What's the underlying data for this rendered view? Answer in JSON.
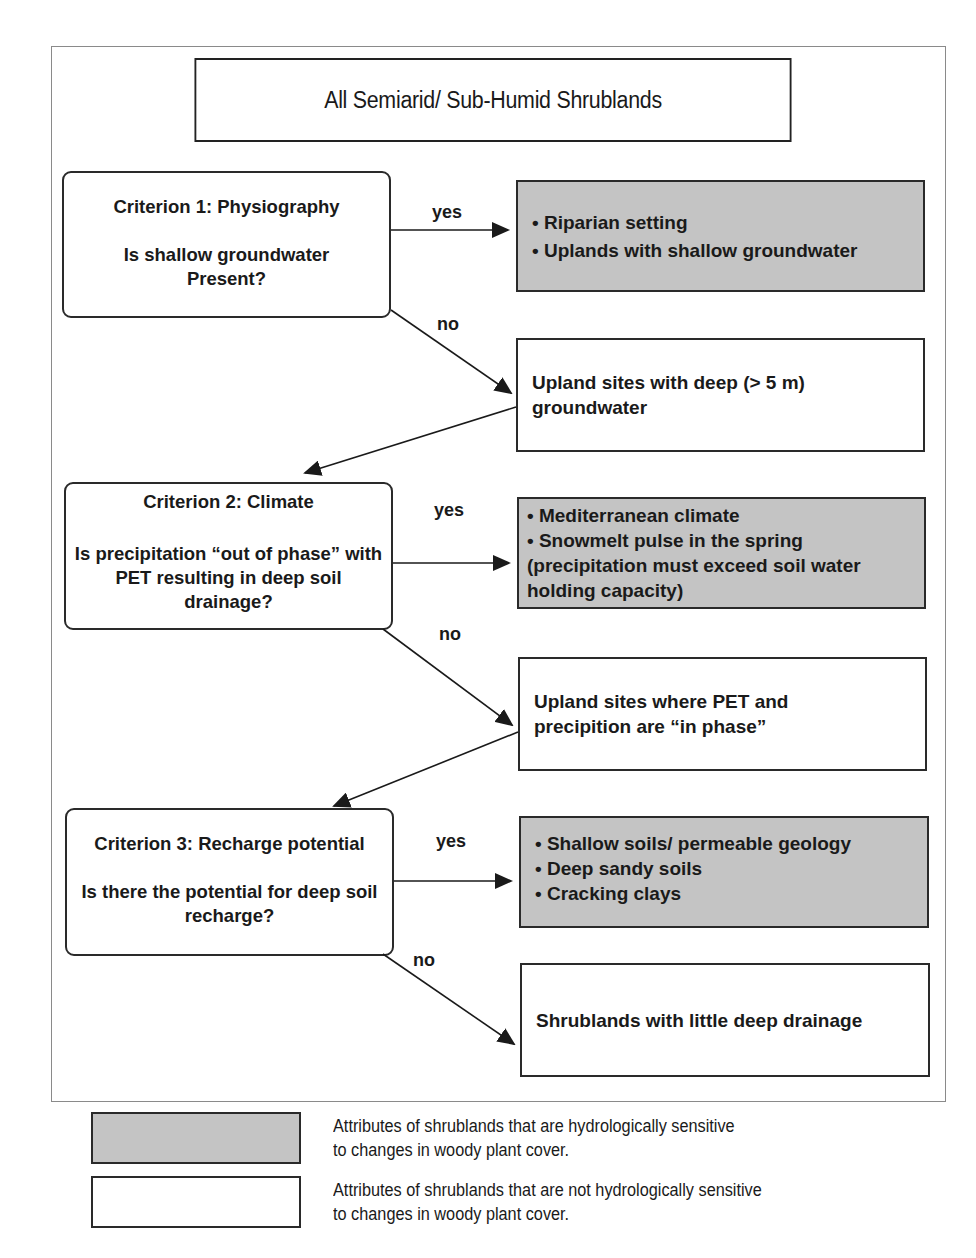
{
  "title": "All Semiarid/ Sub-Humid Shrublands",
  "colors": {
    "sensitive_fill": "#c4c4c4",
    "not_sensitive_fill": "#ffffff",
    "line": "#1a1a1a"
  },
  "criteria": [
    {
      "heading": "Criterion 1: Physiography",
      "question": "Is shallow groundwater Present?",
      "yes_label": "yes",
      "no_label": "no",
      "yes_outcome": {
        "sensitive": true,
        "items": [
          "• Riparian setting",
          "• Uplands with shallow groundwater"
        ]
      },
      "no_outcome": {
        "sensitive": false,
        "text": "Upland sites with deep (> 5 m) groundwater"
      }
    },
    {
      "heading": "Criterion 2: Climate",
      "question": "Is precipitation “out of phase” with PET resulting in deep soil drainage?",
      "yes_label": "yes",
      "no_label": "no",
      "yes_outcome": {
        "sensitive": true,
        "items": [
          "• Mediterranean climate",
          "• Snowmelt pulse in the spring",
          "(precipitation must exceed soil water holding capacity)"
        ]
      },
      "no_outcome": {
        "sensitive": false,
        "text": "Upland sites where PET and precipition are “in phase”"
      }
    },
    {
      "heading": "Criterion 3: Recharge potential",
      "question": "Is there the potential for deep soil recharge?",
      "yes_label": "yes",
      "no_label": "no",
      "yes_outcome": {
        "sensitive": true,
        "items": [
          "• Shallow soils/ permeable geology",
          "• Deep sandy soils",
          "• Cracking clays"
        ]
      },
      "no_outcome": {
        "sensitive": false,
        "text": "Shrublands with little deep drainage"
      }
    }
  ],
  "legend": [
    {
      "swatch": "gray",
      "text_line1": "Attributes of shrublands that are hydrologically sensitive",
      "text_line2": "to changes in woody plant cover."
    },
    {
      "swatch": "white",
      "text_line1": "Attributes of shrublands that are not hydrologically sensitive",
      "text_line2": "to changes in woody plant cover."
    }
  ]
}
